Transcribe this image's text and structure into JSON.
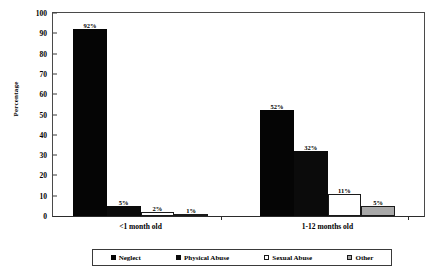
{
  "chart_data": {
    "type": "bar",
    "title": "",
    "xlabel": "",
    "ylabel": "Percentage",
    "ylim": [
      0,
      100
    ],
    "ytick_labels": [
      "0",
      "10",
      "20",
      "30",
      "40",
      "50",
      "60",
      "70",
      "80",
      "90",
      "100"
    ],
    "ytick_values": [
      0,
      10,
      20,
      30,
      40,
      50,
      60,
      70,
      80,
      90,
      100
    ],
    "grid": false,
    "legend_position": "bottom",
    "categories": [
      "<1 month old",
      "1-12 months old"
    ],
    "series": [
      {
        "name": "Neglect",
        "values": [
          92,
          52
        ],
        "labels": [
          "92%",
          "52%"
        ],
        "color": "#050505",
        "style": "solid-black"
      },
      {
        "name": "Physical Abuse",
        "values": [
          5,
          32
        ],
        "labels": [
          "5%",
          "32%"
        ],
        "color": "#0b0b0b",
        "style": "solid-black"
      },
      {
        "name": "Sexual Abuse",
        "values": [
          2,
          11
        ],
        "labels": [
          "2%",
          "11%"
        ],
        "color": "#ffffff",
        "style": "open-white"
      },
      {
        "name": "Other",
        "values": [
          1,
          5
        ],
        "labels": [
          "1%",
          "5%"
        ],
        "color": "#a8a8a8",
        "style": "gray-fill"
      }
    ]
  },
  "axis": {
    "y_title": "Percentage"
  },
  "legend": {
    "items": [
      {
        "label": "Neglect"
      },
      {
        "label": "Physical Abuse"
      },
      {
        "label": "Sexual Abuse"
      },
      {
        "label": "Other"
      }
    ]
  }
}
